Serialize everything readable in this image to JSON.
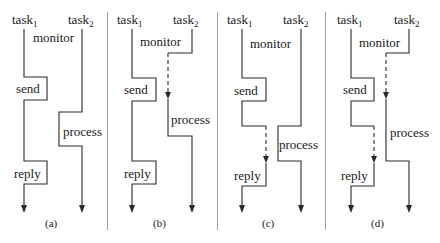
{
  "figure": {
    "panels": [
      {
        "id": "a",
        "caption": "(a)",
        "task1_label": "task",
        "task1_sub": "1",
        "task2_label": "task",
        "task2_sub": "2",
        "monitor_label": "monitor",
        "send_label": "send",
        "process_label": "process",
        "reply_label": "reply",
        "dashed_wait_task2": false,
        "dashed_wait_task1": false
      },
      {
        "id": "b",
        "caption": "(b)",
        "task1_label": "task",
        "task1_sub": "1",
        "task2_label": "task",
        "task2_sub": "2",
        "monitor_label": "monitor",
        "send_label": "send",
        "process_label": "process",
        "reply_label": "reply",
        "dashed_wait_task2": true,
        "dashed_wait_task1": false
      },
      {
        "id": "c",
        "caption": "(c)",
        "task1_label": "task",
        "task1_sub": "1",
        "task2_label": "task",
        "task2_sub": "2",
        "monitor_label": "monitor",
        "send_label": "send",
        "process_label": "process",
        "reply_label": "reply",
        "dashed_wait_task2": false,
        "dashed_wait_task1": true
      },
      {
        "id": "d",
        "caption": "(d)",
        "task1_label": "task",
        "task1_sub": "1",
        "task2_label": "task",
        "task2_sub": "2",
        "monitor_label": "monitor",
        "send_label": "send",
        "process_label": "process",
        "reply_label": "reply",
        "dashed_wait_task2": true,
        "dashed_wait_task1": true
      }
    ],
    "colors": {
      "line": "#2a2a2a",
      "text": "#1a1a1a",
      "divider": "#a0a0a0",
      "background": "#ffffff"
    }
  }
}
